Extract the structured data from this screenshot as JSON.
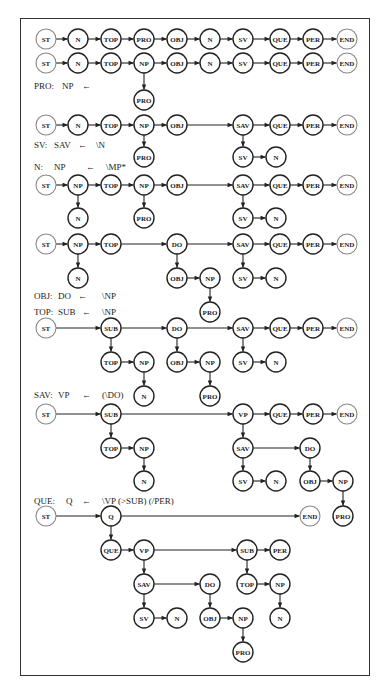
{
  "figure": {
    "nodes": [
      {
        "id": "r1_st",
        "label": "ST",
        "x": 46,
        "y": 39,
        "light": true
      },
      {
        "id": "r1_n",
        "label": "N",
        "x": 78,
        "y": 39
      },
      {
        "id": "r1_top",
        "label": "TOP",
        "x": 111,
        "y": 39
      },
      {
        "id": "r1_pro",
        "label": "PRO",
        "x": 144,
        "y": 39
      },
      {
        "id": "r1_obj",
        "label": "OBJ",
        "x": 177,
        "y": 39
      },
      {
        "id": "r1_n2",
        "label": "N",
        "x": 210,
        "y": 39
      },
      {
        "id": "r1_sv",
        "label": "SV",
        "x": 243,
        "y": 39
      },
      {
        "id": "r1_que",
        "label": "QUE",
        "x": 280,
        "y": 39
      },
      {
        "id": "r1_per",
        "label": "PER",
        "x": 313,
        "y": 39
      },
      {
        "id": "r1_end",
        "label": "END",
        "x": 347,
        "y": 39,
        "light": true
      },
      {
        "id": "r2_st",
        "label": "ST",
        "x": 46,
        "y": 63,
        "light": true
      },
      {
        "id": "r2_n",
        "label": "N",
        "x": 78,
        "y": 63
      },
      {
        "id": "r2_top",
        "label": "TOP",
        "x": 111,
        "y": 63
      },
      {
        "id": "r2_np",
        "label": "NP",
        "x": 144,
        "y": 63
      },
      {
        "id": "r2_obj",
        "label": "OBJ",
        "x": 177,
        "y": 63
      },
      {
        "id": "r2_n2",
        "label": "N",
        "x": 210,
        "y": 63
      },
      {
        "id": "r2_sv",
        "label": "SV",
        "x": 243,
        "y": 63
      },
      {
        "id": "r2_que",
        "label": "QUE",
        "x": 280,
        "y": 63
      },
      {
        "id": "r2_per",
        "label": "PER",
        "x": 313,
        "y": 63
      },
      {
        "id": "r2_end",
        "label": "END",
        "x": 347,
        "y": 63,
        "light": true
      },
      {
        "id": "r2_pro",
        "label": "PRO",
        "x": 144,
        "y": 100
      },
      {
        "id": "r3_st",
        "label": "ST",
        "x": 46,
        "y": 125,
        "light": true
      },
      {
        "id": "r3_n",
        "label": "N",
        "x": 78,
        "y": 125
      },
      {
        "id": "r3_top",
        "label": "TOP",
        "x": 111,
        "y": 125
      },
      {
        "id": "r3_np",
        "label": "NP",
        "x": 144,
        "y": 125
      },
      {
        "id": "r3_obj",
        "label": "OBJ",
        "x": 177,
        "y": 125
      },
      {
        "id": "r3_sav",
        "label": "SAV",
        "x": 243,
        "y": 125
      },
      {
        "id": "r3_que",
        "label": "QUE",
        "x": 280,
        "y": 125
      },
      {
        "id": "r3_per",
        "label": "PER",
        "x": 313,
        "y": 125
      },
      {
        "id": "r3_end",
        "label": "END",
        "x": 347,
        "y": 125,
        "light": true
      },
      {
        "id": "r3_pro",
        "label": "PRO",
        "x": 144,
        "y": 157
      },
      {
        "id": "r3_sv",
        "label": "SV",
        "x": 243,
        "y": 157
      },
      {
        "id": "r3_n2",
        "label": "N",
        "x": 276,
        "y": 157
      },
      {
        "id": "r4_st",
        "label": "ST",
        "x": 46,
        "y": 185,
        "light": true
      },
      {
        "id": "r4_np",
        "label": "NP",
        "x": 78,
        "y": 185
      },
      {
        "id": "r4_top",
        "label": "TOP",
        "x": 111,
        "y": 185
      },
      {
        "id": "r4_np2",
        "label": "NP",
        "x": 144,
        "y": 185
      },
      {
        "id": "r4_obj",
        "label": "OBJ",
        "x": 177,
        "y": 185
      },
      {
        "id": "r4_sav",
        "label": "SAV",
        "x": 243,
        "y": 185
      },
      {
        "id": "r4_que",
        "label": "QUE",
        "x": 280,
        "y": 185
      },
      {
        "id": "r4_per",
        "label": "PER",
        "x": 313,
        "y": 185
      },
      {
        "id": "r4_end",
        "label": "END",
        "x": 347,
        "y": 185,
        "light": true
      },
      {
        "id": "r4_n",
        "label": "N",
        "x": 78,
        "y": 218
      },
      {
        "id": "r4_pro",
        "label": "PRO",
        "x": 144,
        "y": 218
      },
      {
        "id": "r4_sv",
        "label": "SV",
        "x": 243,
        "y": 218
      },
      {
        "id": "r4_n2",
        "label": "N",
        "x": 276,
        "y": 218
      },
      {
        "id": "r5_st",
        "label": "ST",
        "x": 46,
        "y": 244,
        "light": true
      },
      {
        "id": "r5_np",
        "label": "NP",
        "x": 78,
        "y": 244
      },
      {
        "id": "r5_top",
        "label": "TOP",
        "x": 111,
        "y": 244
      },
      {
        "id": "r5_do",
        "label": "DO",
        "x": 177,
        "y": 244
      },
      {
        "id": "r5_sav",
        "label": "SAV",
        "x": 243,
        "y": 244
      },
      {
        "id": "r5_que",
        "label": "QUE",
        "x": 280,
        "y": 244
      },
      {
        "id": "r5_per",
        "label": "PER",
        "x": 313,
        "y": 244
      },
      {
        "id": "r5_end",
        "label": "END",
        "x": 347,
        "y": 244,
        "light": true
      },
      {
        "id": "r5_n",
        "label": "N",
        "x": 78,
        "y": 278
      },
      {
        "id": "r5_obj",
        "label": "OBJ",
        "x": 177,
        "y": 278
      },
      {
        "id": "r5_np2",
        "label": "NP",
        "x": 210,
        "y": 278
      },
      {
        "id": "r5_sv",
        "label": "SV",
        "x": 243,
        "y": 278
      },
      {
        "id": "r5_n2",
        "label": "N",
        "x": 276,
        "y": 278
      },
      {
        "id": "r5_pro",
        "label": "PRO",
        "x": 210,
        "y": 312
      },
      {
        "id": "r6_st",
        "label": "ST",
        "x": 46,
        "y": 328,
        "light": true
      },
      {
        "id": "r6_sub",
        "label": "SUB",
        "x": 111,
        "y": 328
      },
      {
        "id": "r6_do",
        "label": "DO",
        "x": 177,
        "y": 328
      },
      {
        "id": "r6_sav",
        "label": "SAV",
        "x": 243,
        "y": 328
      },
      {
        "id": "r6_que",
        "label": "QUE",
        "x": 280,
        "y": 328
      },
      {
        "id": "r6_per",
        "label": "PER",
        "x": 313,
        "y": 328
      },
      {
        "id": "r6_end",
        "label": "END",
        "x": 347,
        "y": 328,
        "light": true
      },
      {
        "id": "r6_top",
        "label": "TOP",
        "x": 111,
        "y": 362
      },
      {
        "id": "r6_np",
        "label": "NP",
        "x": 144,
        "y": 362
      },
      {
        "id": "r6_obj",
        "label": "OBJ",
        "x": 177,
        "y": 362
      },
      {
        "id": "r6_np2",
        "label": "NP",
        "x": 210,
        "y": 362
      },
      {
        "id": "r6_sv",
        "label": "SV",
        "x": 243,
        "y": 362
      },
      {
        "id": "r6_n2",
        "label": "N",
        "x": 276,
        "y": 362
      },
      {
        "id": "r6_n",
        "label": "N",
        "x": 144,
        "y": 396
      },
      {
        "id": "r6_pro",
        "label": "PRO",
        "x": 210,
        "y": 396
      },
      {
        "id": "r7_st",
        "label": "ST",
        "x": 46,
        "y": 414,
        "light": true
      },
      {
        "id": "r7_sub",
        "label": "SUB",
        "x": 111,
        "y": 414
      },
      {
        "id": "r7_vp",
        "label": "VP",
        "x": 243,
        "y": 414
      },
      {
        "id": "r7_que",
        "label": "QUE",
        "x": 280,
        "y": 414
      },
      {
        "id": "r7_per",
        "label": "PER",
        "x": 313,
        "y": 414
      },
      {
        "id": "r7_end",
        "label": "END",
        "x": 347,
        "y": 414,
        "light": true
      },
      {
        "id": "r7_top",
        "label": "TOP",
        "x": 111,
        "y": 448
      },
      {
        "id": "r7_np",
        "label": "NP",
        "x": 144,
        "y": 448
      },
      {
        "id": "r7_sav",
        "label": "SAV",
        "x": 243,
        "y": 448
      },
      {
        "id": "r7_do",
        "label": "DO",
        "x": 310,
        "y": 448
      },
      {
        "id": "r7_n",
        "label": "N",
        "x": 144,
        "y": 481
      },
      {
        "id": "r7_sv",
        "label": "SV",
        "x": 243,
        "y": 481
      },
      {
        "id": "r7_n2",
        "label": "N",
        "x": 276,
        "y": 481
      },
      {
        "id": "r7_obj",
        "label": "OBJ",
        "x": 310,
        "y": 481
      },
      {
        "id": "r7_np2",
        "label": "NP",
        "x": 343,
        "y": 481
      },
      {
        "id": "r7_pro",
        "label": "PRO",
        "x": 343,
        "y": 516
      },
      {
        "id": "r8_st",
        "label": "ST",
        "x": 46,
        "y": 516,
        "light": true
      },
      {
        "id": "r8_q",
        "label": "Q",
        "x": 111,
        "y": 516
      },
      {
        "id": "r8_end",
        "label": "END",
        "x": 310,
        "y": 516,
        "light": true
      },
      {
        "id": "r8_que",
        "label": "QUE",
        "x": 111,
        "y": 550
      },
      {
        "id": "r8_vp",
        "label": "VP",
        "x": 144,
        "y": 550
      },
      {
        "id": "r8_sub",
        "label": "SUB",
        "x": 247,
        "y": 550
      },
      {
        "id": "r8_per",
        "label": "PER",
        "x": 280,
        "y": 550
      },
      {
        "id": "r8_sav",
        "label": "SAV",
        "x": 144,
        "y": 584
      },
      {
        "id": "r8_do",
        "label": "DO",
        "x": 210,
        "y": 584
      },
      {
        "id": "r8_top",
        "label": "TOP",
        "x": 247,
        "y": 584
      },
      {
        "id": "r8_np",
        "label": "NP",
        "x": 280,
        "y": 584
      },
      {
        "id": "r8_sv",
        "label": "SV",
        "x": 144,
        "y": 618
      },
      {
        "id": "r8_n",
        "label": "N",
        "x": 177,
        "y": 618
      },
      {
        "id": "r8_obj",
        "label": "OBJ",
        "x": 210,
        "y": 618
      },
      {
        "id": "r8_np2",
        "label": "NP",
        "x": 243,
        "y": 618
      },
      {
        "id": "r8_n2",
        "label": "N",
        "x": 280,
        "y": 618
      },
      {
        "id": "r8_pro",
        "label": "PRO",
        "x": 243,
        "y": 652
      }
    ],
    "edges": [
      [
        "r1_st",
        "r1_n"
      ],
      [
        "r1_n",
        "r1_top"
      ],
      [
        "r1_top",
        "r1_pro"
      ],
      [
        "r1_pro",
        "r1_obj"
      ],
      [
        "r1_obj",
        "r1_n2"
      ],
      [
        "r1_n2",
        "r1_sv"
      ],
      [
        "r1_sv",
        "r1_que"
      ],
      [
        "r1_que",
        "r1_per"
      ],
      [
        "r1_per",
        "r1_end"
      ],
      [
        "r2_st",
        "r2_n"
      ],
      [
        "r2_n",
        "r2_top"
      ],
      [
        "r2_top",
        "r2_np"
      ],
      [
        "r2_np",
        "r2_obj"
      ],
      [
        "r2_obj",
        "r2_n2"
      ],
      [
        "r2_n2",
        "r2_sv"
      ],
      [
        "r2_sv",
        "r2_que"
      ],
      [
        "r2_que",
        "r2_per"
      ],
      [
        "r2_per",
        "r2_end"
      ],
      [
        "r2_np",
        "r2_pro"
      ],
      [
        "r3_st",
        "r3_n"
      ],
      [
        "r3_n",
        "r3_top"
      ],
      [
        "r3_top",
        "r3_np"
      ],
      [
        "r3_np",
        "r3_obj"
      ],
      [
        "r3_obj",
        "r3_sav"
      ],
      [
        "r3_sav",
        "r3_que"
      ],
      [
        "r3_que",
        "r3_per"
      ],
      [
        "r3_per",
        "r3_end"
      ],
      [
        "r3_np",
        "r3_pro"
      ],
      [
        "r3_sav",
        "r3_sv"
      ],
      [
        "r3_sv",
        "r3_n2"
      ],
      [
        "r4_st",
        "r4_np"
      ],
      [
        "r4_np",
        "r4_top"
      ],
      [
        "r4_top",
        "r4_np2"
      ],
      [
        "r4_np2",
        "r4_obj"
      ],
      [
        "r4_obj",
        "r4_sav"
      ],
      [
        "r4_sav",
        "r4_que"
      ],
      [
        "r4_que",
        "r4_per"
      ],
      [
        "r4_per",
        "r4_end"
      ],
      [
        "r4_np",
        "r4_n"
      ],
      [
        "r4_np2",
        "r4_pro"
      ],
      [
        "r4_sav",
        "r4_sv"
      ],
      [
        "r4_sv",
        "r4_n2"
      ],
      [
        "r5_st",
        "r5_np"
      ],
      [
        "r5_np",
        "r5_top"
      ],
      [
        "r5_top",
        "r5_do"
      ],
      [
        "r5_do",
        "r5_sav"
      ],
      [
        "r5_sav",
        "r5_que"
      ],
      [
        "r5_que",
        "r5_per"
      ],
      [
        "r5_per",
        "r5_end"
      ],
      [
        "r5_np",
        "r5_n"
      ],
      [
        "r5_do",
        "r5_obj"
      ],
      [
        "r5_obj",
        "r5_np2"
      ],
      [
        "r5_np2",
        "r5_pro"
      ],
      [
        "r5_sav",
        "r5_sv"
      ],
      [
        "r5_sv",
        "r5_n2"
      ],
      [
        "r6_st",
        "r6_sub"
      ],
      [
        "r6_sub",
        "r6_do"
      ],
      [
        "r6_do",
        "r6_sav"
      ],
      [
        "r6_sav",
        "r6_que"
      ],
      [
        "r6_que",
        "r6_per"
      ],
      [
        "r6_per",
        "r6_end"
      ],
      [
        "r6_sub",
        "r6_top"
      ],
      [
        "r6_top",
        "r6_np"
      ],
      [
        "r6_np",
        "r6_n"
      ],
      [
        "r6_do",
        "r6_obj"
      ],
      [
        "r6_obj",
        "r6_np2"
      ],
      [
        "r6_np2",
        "r6_pro"
      ],
      [
        "r6_sav",
        "r6_sv"
      ],
      [
        "r6_sv",
        "r6_n2"
      ],
      [
        "r7_st",
        "r7_sub"
      ],
      [
        "r7_sub",
        "r7_vp"
      ],
      [
        "r7_vp",
        "r7_que"
      ],
      [
        "r7_que",
        "r7_per"
      ],
      [
        "r7_per",
        "r7_end"
      ],
      [
        "r7_sub",
        "r7_top"
      ],
      [
        "r7_top",
        "r7_np"
      ],
      [
        "r7_np",
        "r7_n"
      ],
      [
        "r7_vp",
        "r7_sav"
      ],
      [
        "r7_sav",
        "r7_do"
      ],
      [
        "r7_sav",
        "r7_sv"
      ],
      [
        "r7_sv",
        "r7_n2"
      ],
      [
        "r7_do",
        "r7_obj"
      ],
      [
        "r7_obj",
        "r7_np2"
      ],
      [
        "r7_np2",
        "r7_pro"
      ],
      [
        "r8_st",
        "r8_q"
      ],
      [
        "r8_q",
        "r8_end"
      ],
      [
        "r8_q",
        "r8_que"
      ],
      [
        "r8_que",
        "r8_vp"
      ],
      [
        "r8_vp",
        "r8_sub"
      ],
      [
        "r8_sub",
        "r8_per"
      ],
      [
        "r8_vp",
        "r8_sav"
      ],
      [
        "r8_sav",
        "r8_do"
      ],
      [
        "r8_sav",
        "r8_sv"
      ],
      [
        "r8_sv",
        "r8_n"
      ],
      [
        "r8_do",
        "r8_obj"
      ],
      [
        "r8_obj",
        "r8_np2"
      ],
      [
        "r8_np2",
        "r8_pro"
      ],
      [
        "r8_sub",
        "r8_top"
      ],
      [
        "r8_top",
        "r8_np"
      ],
      [
        "r8_np",
        "r8_n2"
      ]
    ],
    "rules": [
      {
        "id": "rule_pro",
        "x": 34,
        "y": 82,
        "parts": [
          {
            "text": "PRO:",
            "dx": 0
          },
          {
            "text": "NP",
            "dx": 28
          },
          {
            "text": "←",
            "dx": 48
          }
        ]
      },
      {
        "id": "rule_sv",
        "x": 34,
        "y": 141,
        "parts": [
          {
            "text": "SV:",
            "dx": 0
          },
          {
            "text": "SAV",
            "dx": 20
          },
          {
            "text": "←",
            "dx": 44
          },
          {
            "text": "\\N",
            "dx": 62
          }
        ]
      },
      {
        "id": "rule_n",
        "x": 34,
        "y": 163,
        "parts": [
          {
            "text": "N:",
            "dx": 0
          },
          {
            "text": "NP",
            "dx": 20
          },
          {
            "text": "←",
            "dx": 52
          },
          {
            "text": "\\MP*",
            "dx": 72
          }
        ]
      },
      {
        "id": "rule_obj",
        "x": 34,
        "y": 292,
        "parts": [
          {
            "text": "OBJ:",
            "dx": 0
          },
          {
            "text": "DO",
            "dx": 24
          },
          {
            "text": "←",
            "dx": 44
          },
          {
            "text": "\\NP",
            "dx": 68
          }
        ]
      },
      {
        "id": "rule_top",
        "x": 34,
        "y": 308,
        "parts": [
          {
            "text": "TOP:",
            "dx": 0
          },
          {
            "text": "SUB",
            "dx": 24
          },
          {
            "text": "←",
            "dx": 48
          },
          {
            "text": "\\NP",
            "dx": 68
          }
        ]
      },
      {
        "id": "rule_sav",
        "x": 34,
        "y": 391,
        "parts": [
          {
            "text": "SAV:",
            "dx": 0
          },
          {
            "text": "VP",
            "dx": 24
          },
          {
            "text": "←",
            "dx": 48
          },
          {
            "text": "(\\DO)",
            "dx": 68
          }
        ]
      },
      {
        "id": "rule_que",
        "x": 34,
        "y": 497,
        "parts": [
          {
            "text": "QUE:",
            "dx": 0
          },
          {
            "text": "Q",
            "dx": 32
          },
          {
            "text": "←",
            "dx": 48
          },
          {
            "text": "\\VP (>SUB) (/PER)",
            "dx": 68
          }
        ]
      }
    ]
  }
}
